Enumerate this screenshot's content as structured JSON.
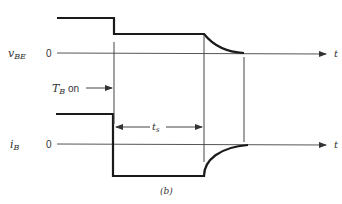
{
  "figure": {
    "caption": "(b)",
    "time_axis_label": "t"
  },
  "vbe_plot": {
    "label_main": "v",
    "label_sub": "BE",
    "zero_label": "0"
  },
  "ib_plot": {
    "label_main": "i",
    "label_sub": "B",
    "zero_label": "0"
  },
  "annotations": {
    "tb_on_main": "T",
    "tb_on_sub": "B",
    "tb_on_suffix": " on",
    "ts_main": "t",
    "ts_sub": "s"
  },
  "colors": {
    "waveform": "#1a1a1a",
    "axis": "#555555",
    "text": "#333333"
  }
}
